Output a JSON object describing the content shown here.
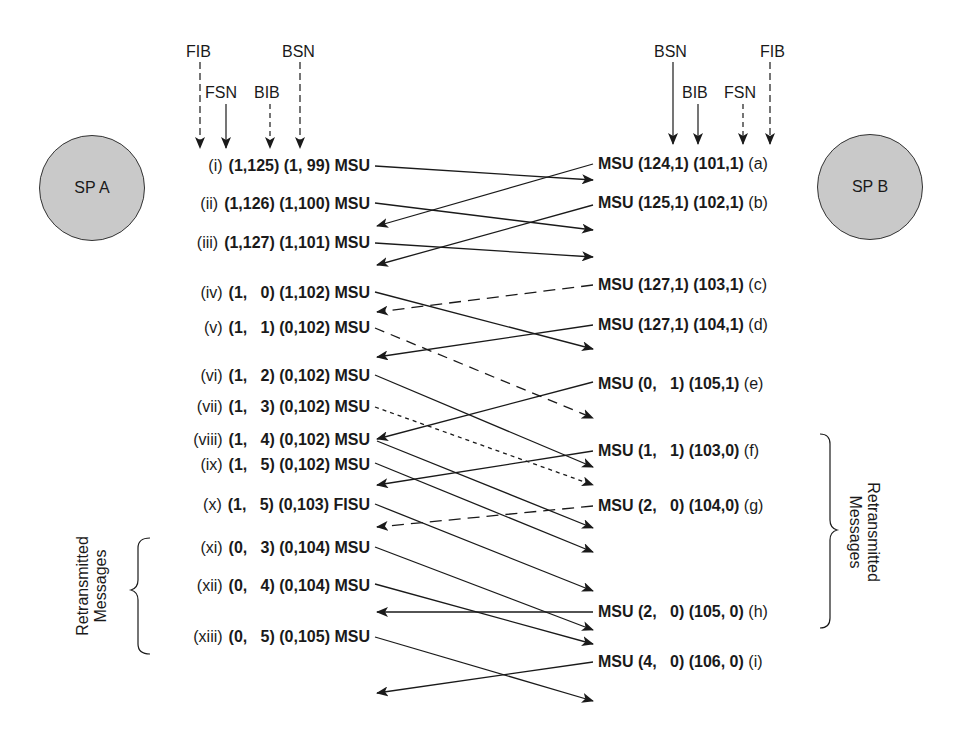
{
  "diagram": {
    "type": "SS7 MTP2 signal unit sequence diagram (retransmission)",
    "nodes": {
      "a": {
        "label": "SP A"
      },
      "b": {
        "label": "SP B"
      }
    },
    "field_headers_a": {
      "fib": "FIB",
      "fsn": "FSN",
      "bib": "BIB",
      "bsn": "BSN"
    },
    "field_headers_b": {
      "bsn": "BSN",
      "bib": "BIB",
      "fsn": "FSN",
      "fib": "FIB"
    },
    "retransmit_label_a": {
      "line1": "Retransmitted",
      "line2": "Messages"
    },
    "retransmit_label_b": {
      "line1": "Retransmitted",
      "line2": "Messages"
    },
    "rows_a": [
      {
        "idx": "(i)",
        "fwd": "(1,125)",
        "bwd": "(1, 99)",
        "type": "MSU"
      },
      {
        "idx": "(ii)",
        "fwd": "(1,126)",
        "bwd": "(1,100)",
        "type": "MSU"
      },
      {
        "idx": "(iii)",
        "fwd": "(1,127)",
        "bwd": "(1,101)",
        "type": "MSU"
      },
      {
        "idx": "(iv)",
        "fwd": "(1,   0)",
        "bwd": "(1,102)",
        "type": "MSU"
      },
      {
        "idx": "(v)",
        "fwd": "(1,   1)",
        "bwd": "(0,102)",
        "type": "MSU"
      },
      {
        "idx": "(vi)",
        "fwd": "(1,   2)",
        "bwd": "(0,102)",
        "type": "MSU"
      },
      {
        "idx": "(vii)",
        "fwd": "(1,   3)",
        "bwd": "(0,102)",
        "type": "MSU"
      },
      {
        "idx": "(viii)",
        "fwd": "(1,   4)",
        "bwd": "(0,102)",
        "type": "MSU"
      },
      {
        "idx": "(ix)",
        "fwd": "(1,   5)",
        "bwd": "(0,102)",
        "type": "MSU"
      },
      {
        "idx": "(x)",
        "fwd": "(1,   5)",
        "bwd": "(0,103)",
        "type": "FISU"
      },
      {
        "idx": "(xi)",
        "fwd": "(0,   3)",
        "bwd": "(0,104)",
        "type": "MSU"
      },
      {
        "idx": "(xii)",
        "fwd": "(0,   4)",
        "bwd": "(0,104)",
        "type": "MSU"
      },
      {
        "idx": "(xiii)",
        "fwd": "(0,   5)",
        "bwd": "(0,105)",
        "type": "MSU"
      }
    ],
    "rows_b": [
      {
        "idx": "(a)",
        "type": "MSU",
        "bwd": "(124,1)",
        "fwd": "(101,1)"
      },
      {
        "idx": "(b)",
        "type": "MSU",
        "bwd": "(125,1)",
        "fwd": "(102,1)"
      },
      {
        "idx": "(c)",
        "type": "MSU",
        "bwd": "(127,1)",
        "fwd": "(103,1)"
      },
      {
        "idx": "(d)",
        "type": "MSU",
        "bwd": "(127,1)",
        "fwd": "(104,1)"
      },
      {
        "idx": "(e)",
        "type": "MSU",
        "bwd": "(0,   1)",
        "fwd": "(105,1)"
      },
      {
        "idx": "(f)",
        "type": "MSU",
        "bwd": "(1,   1)",
        "fwd": "(103,0)"
      },
      {
        "idx": "(g)",
        "type": "MSU",
        "bwd": "(2,   0)",
        "fwd": "(104,0)"
      },
      {
        "idx": "(h)",
        "type": "MSU",
        "bwd": "(2,   0)",
        "fwd": "(105, 0)"
      },
      {
        "idx": "(i)",
        "type": "MSU",
        "bwd": "(4,   0)",
        "fwd": "(106, 0)"
      }
    ],
    "arrows_a_to_b": [
      {
        "from": "(i)",
        "style": "solid"
      },
      {
        "from": "(ii)",
        "style": "solid"
      },
      {
        "from": "(iii)",
        "style": "solid"
      },
      {
        "from": "(iv)",
        "style": "solid"
      },
      {
        "from": "(v)",
        "style": "dashed",
        "note": "lost"
      },
      {
        "from": "(vi)",
        "style": "solid"
      },
      {
        "from": "(vii)",
        "style": "dotted",
        "note": "lost"
      },
      {
        "from": "(viii)",
        "style": "solid"
      },
      {
        "from": "(ix)",
        "style": "solid"
      },
      {
        "from": "(x)",
        "style": "solid"
      },
      {
        "from": "(xi)",
        "style": "solid"
      },
      {
        "from": "(xii)",
        "style": "solid"
      },
      {
        "from": "(xiii)",
        "style": "solid"
      }
    ],
    "arrows_b_to_a": [
      {
        "from": "(a)",
        "style": "solid"
      },
      {
        "from": "(b)",
        "style": "solid"
      },
      {
        "from": "(c)",
        "style": "dashed",
        "note": "lost"
      },
      {
        "from": "(d)",
        "style": "solid"
      },
      {
        "from": "(e)",
        "style": "solid"
      },
      {
        "from": "(f)",
        "style": "solid"
      },
      {
        "from": "(g)",
        "style": "dashed",
        "note": "lost"
      },
      {
        "from": "(h)",
        "style": "solid"
      },
      {
        "from": "(i)",
        "style": "solid"
      }
    ]
  }
}
